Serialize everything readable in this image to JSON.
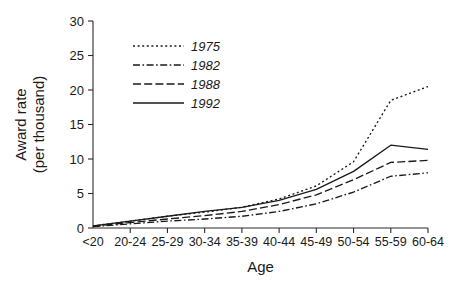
{
  "chart_data": {
    "type": "line",
    "title": "",
    "xlabel": "Age",
    "ylabel": "Award rate\n(per thousand)",
    "ylabel_line1": "Award rate",
    "ylabel_line2": "(per thousand)",
    "categories": [
      "<20",
      "20-24",
      "25-29",
      "30-34",
      "35-39",
      "40-44",
      "45-49",
      "50-54",
      "55-59",
      "60-64"
    ],
    "ylim": [
      0,
      30
    ],
    "yticks": [
      0,
      5,
      10,
      15,
      20,
      25,
      30
    ],
    "ytick_labels": [
      "0",
      "5",
      "10",
      "15",
      "20",
      "25",
      "30"
    ],
    "grid": false,
    "legend_position": "upper-left-inside",
    "series": [
      {
        "name": "1975",
        "style": "dotted",
        "dash_pattern": "2,2.6",
        "values": [
          0.3,
          1.0,
          1.7,
          2.3,
          3.0,
          4.2,
          6.1,
          9.6,
          18.5,
          20.5
        ]
      },
      {
        "name": "1982",
        "style": "dash-dot",
        "dash_pattern": "7,2.5,1.6,2.5",
        "values": [
          0.2,
          0.6,
          1.0,
          1.3,
          1.7,
          2.4,
          3.5,
          5.2,
          7.5,
          8.0
        ]
      },
      {
        "name": "1988",
        "style": "dashed",
        "dash_pattern": "8,3.2",
        "values": [
          0.25,
          0.8,
          1.3,
          1.8,
          2.4,
          3.4,
          4.8,
          7.0,
          9.5,
          9.8
        ]
      },
      {
        "name": "1992",
        "style": "solid",
        "dash_pattern": "none",
        "values": [
          0.3,
          1.0,
          1.7,
          2.4,
          3.0,
          4.0,
          5.6,
          8.2,
          12.0,
          11.4
        ]
      }
    ]
  },
  "figure": {
    "background_color": "#ffffff",
    "line_color": "#1a1a1a",
    "text_color": "#1a1a1a"
  }
}
